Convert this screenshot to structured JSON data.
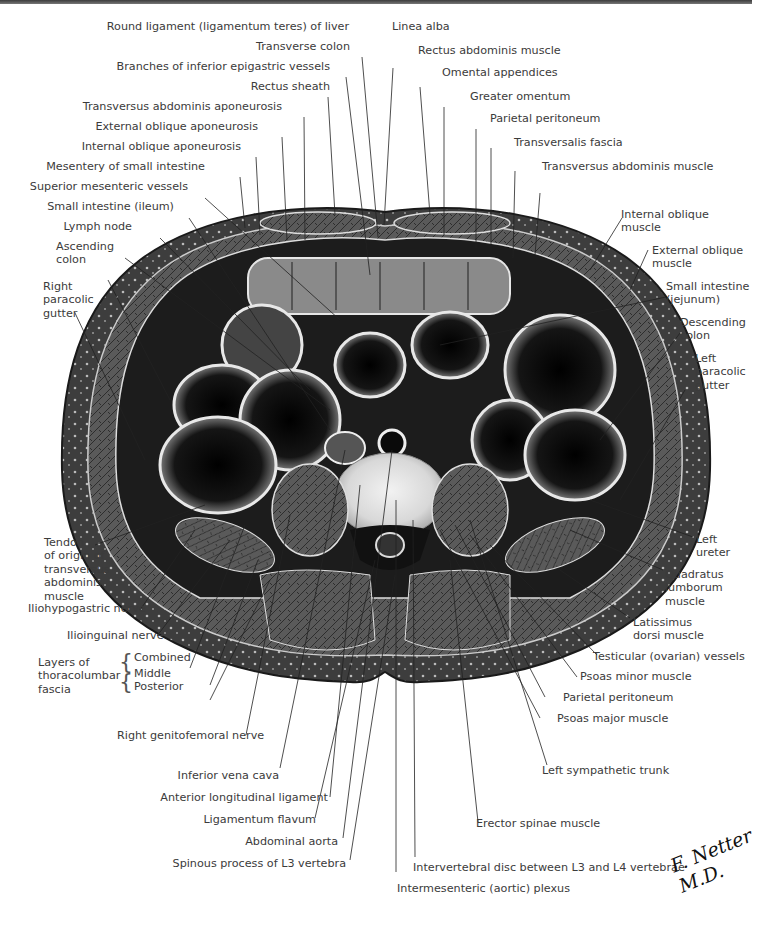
{
  "figure": {
    "artist_signature": "F. Netter M.D."
  },
  "labels": {
    "top": [
      {
        "id": "round-ligament",
        "text": "Round ligament (ligamentum teres) of liver"
      },
      {
        "id": "linea-alba",
        "text": "Linea alba"
      },
      {
        "id": "transverse-colon",
        "text": "Transverse colon"
      },
      {
        "id": "rectus-abdominis-muscle",
        "text": "Rectus abdominis muscle"
      },
      {
        "id": "inferior-epigastric-vessels",
        "text": "Branches of inferior epigastric vessels"
      },
      {
        "id": "omental-appendices",
        "text": "Omental appendices"
      },
      {
        "id": "rectus-sheath",
        "text": "Rectus sheath"
      },
      {
        "id": "greater-omentum",
        "text": "Greater omentum"
      },
      {
        "id": "transversus-abdominis-aponeurosis",
        "text": "Transversus abdominis aponeurosis"
      },
      {
        "id": "parietal-peritoneum-top",
        "text": "Parietal peritoneum"
      },
      {
        "id": "external-oblique-aponeurosis",
        "text": "External oblique aponeurosis"
      },
      {
        "id": "transversalis-fascia",
        "text": "Transversalis fascia"
      },
      {
        "id": "internal-oblique-aponeurosis",
        "text": "Internal oblique aponeurosis"
      },
      {
        "id": "mesentery-small-intestine",
        "text": "Mesentery of small intestine"
      },
      {
        "id": "transversus-abdominis-muscle",
        "text": "Transversus abdominis muscle"
      },
      {
        "id": "superior-mesenteric-vessels",
        "text": "Superior mesenteric vessels"
      },
      {
        "id": "small-intestine-ileum",
        "text": "Small intestine (ileum)"
      },
      {
        "id": "lymph-node",
        "text": "Lymph node"
      }
    ],
    "left": [
      {
        "id": "ascending-colon",
        "text": "Ascending\ncolon"
      },
      {
        "id": "right-paracolic-gutter",
        "text": "Right\nparacolic\ngutter"
      },
      {
        "id": "tendon-transversus",
        "text": "Tendon\nof origin of\ntransversus\nabdominis\nmuscle"
      },
      {
        "id": "iliohypogastric-nerve",
        "text": "Iliohypogastric nerve"
      },
      {
        "id": "ilioinguinal-nerve",
        "text": "Ilioinguinal nerve"
      },
      {
        "id": "thoracolumbar-fascia",
        "text": "Layers of\nthoracolumbar\nfascia"
      },
      {
        "id": "fascia-combined",
        "text": "Combined"
      },
      {
        "id": "fascia-middle",
        "text": "Middle"
      },
      {
        "id": "fascia-posterior",
        "text": "Posterior"
      },
      {
        "id": "right-genitofemoral-nerve",
        "text": "Right genitofemoral nerve"
      }
    ],
    "right": [
      {
        "id": "internal-oblique-muscle",
        "text": "Internal oblique\nmuscle"
      },
      {
        "id": "external-oblique-muscle",
        "text": "External oblique\nmuscle"
      },
      {
        "id": "small-intestine-jejunum",
        "text": "Small intestine\n(jejunum)"
      },
      {
        "id": "descending-colon",
        "text": "Descending\ncolon"
      },
      {
        "id": "left-paracolic-gutter",
        "text": "Left\nparacolic\ngutter"
      },
      {
        "id": "left-ureter",
        "text": "Left\nureter"
      },
      {
        "id": "quadratus-lumborum",
        "text": "Quadratus\nlumborum\nmuscle"
      },
      {
        "id": "latissimus-dorsi",
        "text": "Latissimus\ndorsi muscle"
      },
      {
        "id": "testicular-vessels",
        "text": "Testicular (ovarian) vessels"
      },
      {
        "id": "psoas-minor",
        "text": "Psoas minor muscle"
      },
      {
        "id": "parietal-peritoneum-bottom",
        "text": "Parietal peritoneum"
      },
      {
        "id": "psoas-major",
        "text": "Psoas major muscle"
      }
    ],
    "bottom": [
      {
        "id": "left-sympathetic-trunk",
        "text": "Left sympathetic trunk"
      },
      {
        "id": "inferior-vena-cava",
        "text": "Inferior vena cava"
      },
      {
        "id": "anterior-longitudinal-ligament",
        "text": "Anterior longitudinal ligament"
      },
      {
        "id": "erector-spinae",
        "text": "Erector spinae muscle"
      },
      {
        "id": "ligamentum-flavum",
        "text": "Ligamentum flavum"
      },
      {
        "id": "abdominal-aorta",
        "text": "Abdominal aorta"
      },
      {
        "id": "spinous-process-l3",
        "text": "Spinous process of L3 vertebra"
      },
      {
        "id": "intervertebral-disc",
        "text": "Intervertebral disc between L3 and L4 vertebrae"
      },
      {
        "id": "intermesenteric-plexus",
        "text": "Intermesenteric (aortic) plexus"
      }
    ]
  },
  "colors": {
    "skin_outer": "#4a4a4a",
    "muscle": "#5e5e5e",
    "fat": "#3a3a3a",
    "lumen": "#0a0a0a",
    "disc": "#dcdcdc",
    "leader": "#222222",
    "text": "#3b3b3b"
  }
}
